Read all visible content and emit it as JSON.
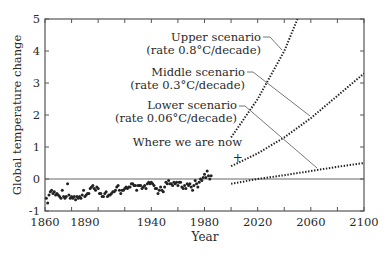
{
  "chart_data": {
    "type": "scatter",
    "title": "",
    "xlabel": "Year",
    "ylabel": "Global temperature change",
    "xlim": [
      1860,
      2100
    ],
    "ylim": [
      -1,
      5
    ],
    "x_ticks": [
      1860,
      1890,
      1940,
      1980,
      2020,
      2060,
      2100
    ],
    "x_minor_ticks": [
      1860,
      1880,
      1900,
      1920,
      1940,
      1960,
      1980,
      2000,
      2020,
      2040,
      2060,
      2080,
      2100
    ],
    "y_ticks": [
      -1,
      0,
      1,
      2,
      3,
      4,
      5
    ],
    "grid": false,
    "reference_line": {
      "y": 0
    },
    "series": [
      {
        "name": "Observed",
        "style": "points",
        "x": [
          1861,
          1862,
          1863,
          1864,
          1865,
          1866,
          1867,
          1868,
          1869,
          1870,
          1871,
          1872,
          1873,
          1874,
          1875,
          1876,
          1877,
          1878,
          1879,
          1880,
          1881,
          1882,
          1883,
          1884,
          1885,
          1886,
          1887,
          1888,
          1889,
          1890,
          1891,
          1892,
          1893,
          1894,
          1895,
          1896,
          1897,
          1898,
          1899,
          1900,
          1901,
          1902,
          1903,
          1904,
          1905,
          1906,
          1907,
          1908,
          1909,
          1910,
          1911,
          1912,
          1913,
          1914,
          1915,
          1916,
          1917,
          1918,
          1919,
          1920,
          1921,
          1922,
          1923,
          1924,
          1925,
          1926,
          1927,
          1928,
          1929,
          1930,
          1931,
          1932,
          1933,
          1934,
          1935,
          1936,
          1937,
          1938,
          1939,
          1940,
          1941,
          1942,
          1943,
          1944,
          1945,
          1946,
          1947,
          1948,
          1949,
          1950,
          1951,
          1952,
          1953,
          1954,
          1955,
          1956,
          1957,
          1958,
          1959,
          1960,
          1961,
          1962,
          1963,
          1964,
          1965,
          1966,
          1967,
          1968,
          1969,
          1970,
          1971,
          1972,
          1973,
          1974,
          1975,
          1976,
          1977,
          1978,
          1979,
          1980,
          1981,
          1982,
          1983,
          1984,
          1985
        ],
        "values": [
          -0.6,
          -0.75,
          -0.5,
          -0.4,
          -0.35,
          -0.45,
          -0.4,
          -0.5,
          -0.45,
          -0.5,
          -0.55,
          -0.6,
          -0.35,
          -0.55,
          -0.6,
          -0.55,
          -0.15,
          -0.5,
          -0.6,
          -0.55,
          -0.6,
          -0.55,
          -0.65,
          -0.55,
          -0.6,
          -0.55,
          -0.6,
          -0.5,
          -0.35,
          -0.55,
          -0.5,
          -0.45,
          -0.45,
          -0.3,
          -0.25,
          -0.2,
          -0.3,
          -0.35,
          -0.25,
          -0.3,
          -0.45,
          -0.45,
          -0.55,
          -0.55,
          -0.45,
          -0.4,
          -0.55,
          -0.5,
          -0.5,
          -0.45,
          -0.4,
          -0.4,
          -0.35,
          -0.25,
          -0.2,
          -0.35,
          -0.45,
          -0.35,
          -0.35,
          -0.3,
          -0.25,
          -0.3,
          -0.25,
          -0.25,
          -0.15,
          -0.15,
          -0.2,
          -0.2,
          -0.35,
          -0.2,
          -0.2,
          -0.2,
          -0.3,
          -0.25,
          -0.2,
          -0.3,
          -0.15,
          -0.1,
          -0.15,
          -0.1,
          -0.15,
          -0.2,
          -0.3,
          -0.3,
          -0.45,
          -0.35,
          -0.25,
          -0.35,
          -0.4,
          -0.25,
          -0.1,
          -0.15,
          -0.05,
          -0.15,
          -0.15,
          -0.2,
          -0.1,
          -0.15,
          -0.1,
          -0.2,
          -0.1,
          -0.1,
          -0.25,
          -0.3,
          -0.2,
          -0.3,
          -0.15,
          -0.2,
          -0.15,
          -0.25,
          -0.35,
          -0.2,
          -0.05,
          -0.15,
          -0.25,
          -0.1,
          0.0,
          -0.05,
          0.05,
          0.15,
          0.05,
          0.25,
          0.1,
          0.0,
          0.1
        ]
      },
      {
        "name": "Upper scenario",
        "label_line1": "Upper scenario",
        "label_line2": "(rate 0.8°C/decade)",
        "style": "dotted",
        "x": [
          2000,
          2020,
          2040,
          2050
        ],
        "values": [
          1.3,
          2.5,
          4.0,
          5.0
        ]
      },
      {
        "name": "Middle scenario",
        "label_line1": "Middle scenario",
        "label_line2": "(rate 0.3°C/decade)",
        "style": "dotted",
        "x": [
          2000,
          2020,
          2040,
          2060,
          2080,
          2100
        ],
        "values": [
          0.4,
          0.8,
          1.3,
          1.9,
          2.6,
          3.3
        ]
      },
      {
        "name": "Lower scenario",
        "label_line1": "Lower scenario",
        "label_line2": "(rate 0.06°C/decade)",
        "style": "dotted",
        "x": [
          2000,
          2020,
          2040,
          2060,
          2080,
          2100
        ],
        "values": [
          -0.15,
          0.0,
          0.12,
          0.25,
          0.38,
          0.5
        ]
      }
    ],
    "annotations": [
      {
        "text": "Where we are now",
        "marker": "+",
        "x": 2005,
        "y": 0.7
      }
    ]
  }
}
